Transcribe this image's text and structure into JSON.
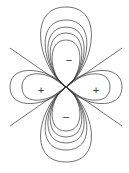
{
  "diagram": {
    "title": "",
    "stroke_color": "#333333",
    "background": "#ffffff",
    "lobes": [
      {
        "id": "top",
        "sign": "−",
        "label_x": 69,
        "label_y": 60
      },
      {
        "id": "bottom",
        "sign": "−",
        "label_x": 66,
        "label_y": 117
      },
      {
        "id": "left",
        "sign": "+",
        "label_x": 41,
        "label_y": 90
      },
      {
        "id": "right",
        "sign": "+",
        "label_x": 96,
        "label_y": 90
      }
    ],
    "nodal_lines": 2,
    "contours_per_lobe_vertical": 5,
    "contours_per_lobe_horizontal": 3
  }
}
